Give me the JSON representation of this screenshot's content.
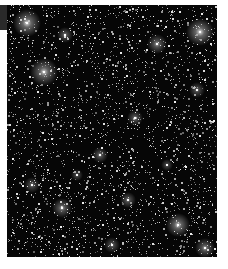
{
  "image": {
    "subject": "star field",
    "background_color": "#060606",
    "frame_color": "#ffffff",
    "tab_color": "#2a2a2a",
    "field": {
      "x": 7,
      "y": 5,
      "width": 210,
      "height": 252
    },
    "faint_star_density": 2600,
    "bright_stars": [
      {
        "x": 20,
        "y": 18,
        "r": 7,
        "glow": 0.9
      },
      {
        "x": 193,
        "y": 27,
        "r": 7,
        "glow": 0.9
      },
      {
        "x": 37,
        "y": 67,
        "r": 7,
        "glow": 0.85
      },
      {
        "x": 150,
        "y": 39,
        "r": 5,
        "glow": 0.7
      },
      {
        "x": 171,
        "y": 220,
        "r": 6,
        "glow": 0.85
      },
      {
        "x": 55,
        "y": 203,
        "r": 5,
        "glow": 0.7
      },
      {
        "x": 121,
        "y": 195,
        "r": 4,
        "glow": 0.6
      },
      {
        "x": 198,
        "y": 243,
        "r": 5,
        "glow": 0.7
      },
      {
        "x": 93,
        "y": 150,
        "r": 4,
        "glow": 0.6
      },
      {
        "x": 128,
        "y": 113,
        "r": 4,
        "glow": 0.6
      },
      {
        "x": 58,
        "y": 30,
        "r": 4,
        "glow": 0.6
      },
      {
        "x": 190,
        "y": 85,
        "r": 4,
        "glow": 0.55
      },
      {
        "x": 25,
        "y": 180,
        "r": 4,
        "glow": 0.55
      },
      {
        "x": 105,
        "y": 240,
        "r": 4,
        "glow": 0.55
      },
      {
        "x": 70,
        "y": 170,
        "r": 3,
        "glow": 0.5
      },
      {
        "x": 160,
        "y": 160,
        "r": 3,
        "glow": 0.5
      }
    ]
  }
}
